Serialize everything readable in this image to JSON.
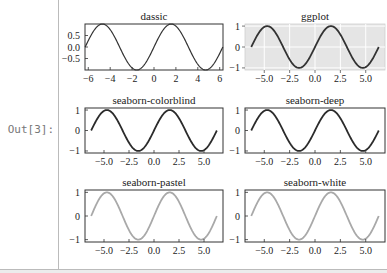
{
  "cell": {
    "prompt": "Out[3]:"
  },
  "chart_data": [
    {
      "type": "line",
      "title": "dassic",
      "style": "classic",
      "x_range": [
        -6.28,
        6.28
      ],
      "function": "sin(x)",
      "xticks": [
        "−6",
        "−4",
        "−2",
        "0",
        "2",
        "4",
        "6"
      ],
      "yticks": [
        "0.5",
        "0.0",
        "−0.5"
      ],
      "xlim": [
        -6.3,
        6.3
      ],
      "ylim": [
        -1,
        1
      ],
      "line_color": "#333333",
      "bg": "#ffffff",
      "grid": false
    },
    {
      "type": "line",
      "title": "ggplot",
      "style": "ggplot",
      "function": "sin(x)",
      "xticks": [
        "−5.0",
        "−2.5",
        "0.0",
        "2.5",
        "5.0"
      ],
      "yticks": [
        "1",
        "0",
        "−1"
      ],
      "ylim": [
        -1.1,
        1.1
      ],
      "line_color": "#333333",
      "bg": "#e5e5e5",
      "grid": true
    },
    {
      "type": "line",
      "title": "seaborn-colorblind",
      "style": "seaborn-colorblind",
      "function": "sin(x)",
      "xticks": [
        "−5.0",
        "−2.5",
        "0.0",
        "2.5",
        "5.0"
      ],
      "yticks": [
        "1",
        "0",
        "−1"
      ],
      "ylim": [
        -1.1,
        1.1
      ],
      "line_color": "#2b2b2b",
      "bg": "#ffffff",
      "grid": false
    },
    {
      "type": "line",
      "title": "seaborn-deep",
      "style": "seaborn-deep",
      "function": "sin(x)",
      "xticks": [
        "−5.0",
        "−2.5",
        "0.0",
        "2.5",
        "5.0"
      ],
      "yticks": [
        "1",
        "0",
        "−1"
      ],
      "ylim": [
        -1.1,
        1.1
      ],
      "line_color": "#2b2b2b",
      "bg": "#ffffff",
      "grid": false
    },
    {
      "type": "line",
      "title": "seaborn-pastel",
      "style": "seaborn-pastel",
      "function": "sin(x)",
      "xticks": [
        "−5.0",
        "−2.5",
        "0.0",
        "2.5",
        "5.0"
      ],
      "yticks": [
        "1",
        "0",
        "−1"
      ],
      "ylim": [
        -1.1,
        1.1
      ],
      "line_color": "#a9a9a9",
      "bg": "#ffffff",
      "grid": false
    },
    {
      "type": "line",
      "title": "seaborn-white",
      "style": "seaborn-white",
      "function": "sin(x)",
      "xticks": [
        "−5.0",
        "−2.5",
        "0.0",
        "2.5",
        "5.0"
      ],
      "yticks": [
        "1",
        "0",
        "−1"
      ],
      "ylim": [
        -1.1,
        1.1
      ],
      "line_color": "#a9a9a9",
      "bg": "#ffffff",
      "grid": false
    }
  ]
}
